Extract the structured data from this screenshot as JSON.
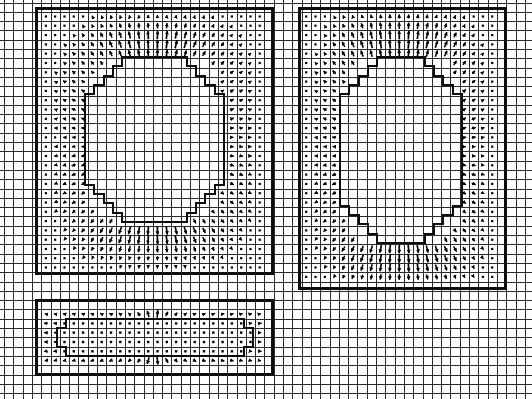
{
  "figure": {
    "width": 532,
    "height": 399,
    "background_color": "#ffffff",
    "line_color": "#1a1a1a",
    "arrow_color": "#000000",
    "type": "vector-field-mesh-plot"
  },
  "grid": {
    "description": "Uniform Cartesian background mesh spanning the full canvas",
    "cell_size": 9.3,
    "origin_x": 4.0,
    "origin_y": 2.5,
    "columns": 57,
    "rows": 43,
    "line_width": 1.0,
    "color": "#2b2b2b",
    "visible": true
  },
  "chart_data": {
    "type": "quiver",
    "xlabel": "",
    "ylabel": "",
    "grid": true,
    "legend": null,
    "cell_size": 9.3,
    "arrow_glyph": {
      "shape": "line-with-filled-triangular-head",
      "zero_marker": "small-filled-square-dot",
      "max_length_px": 9.0
    },
    "regions": [
      {
        "name": "upper-left-domain",
        "outer_rect": {
          "x": 36,
          "y": 8,
          "w": 236,
          "h": 265
        },
        "inner_boundary": "staircase-rounded-rectangle",
        "inner_rect": {
          "x": 85,
          "y": 57,
          "w": 139,
          "h": 165
        },
        "corner_steps": 5,
        "field_band": "annular ring between outer rect and inner staircase",
        "magnitude_peak_zone": "top band and bottom band of the annulus",
        "magnitude_min_zone": "corners of the annulus (near-zero dots)"
      },
      {
        "name": "upper-right-domain",
        "outer_rect": {
          "x": 299,
          "y": 8,
          "w": 206,
          "h": 280
        },
        "inner_boundary": "staircase-rounded-rectangle",
        "inner_rect": {
          "x": 340,
          "y": 57,
          "w": 122,
          "h": 186
        },
        "corner_steps": 5,
        "field_band": "annular ring between outer rect and inner staircase",
        "magnitude_peak_zone": "top band and bottom band of the annulus",
        "magnitude_min_zone": "corners of the annulus (near-zero dots)"
      },
      {
        "name": "lower-wide-domain",
        "outer_rect": {
          "x": 36,
          "y": 300,
          "w": 236,
          "h": 74
        },
        "inner_boundary": "staircase-rounded-rectangle",
        "inner_rect": {
          "x": 57,
          "y": 319,
          "w": 196,
          "h": 37
        },
        "corner_steps": 2,
        "field_band": "thin annular ring, dotted near-zero interior",
        "magnitude_peak_zone": "upper and lower bands of the thin annulus",
        "magnitude_min_zone": "interior rows (dense dot markers)"
      }
    ],
    "notes": [
      "Arrows point radially outward/inward across the annular material bands.",
      "Arrow density and darkness increase where the field magnitude is largest.",
      "Cells with negligible magnitude are drawn as small square dot markers.",
      "Inner curved interfaces are approximated by axis-aligned staircase steps."
    ]
  },
  "axes": {
    "x_ticks_visible": false,
    "y_ticks_visible": false,
    "tick_labels": [],
    "frame": "full-bleed grid, no outer axis spine labels"
  }
}
